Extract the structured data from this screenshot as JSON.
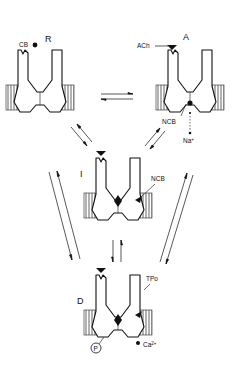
{
  "figure": {
    "type": "kinetic scheme of ion channel states",
    "colors": {
      "ink": "#111111",
      "background": "#ffffff"
    },
    "states": {
      "R": {
        "label": "R",
        "ligand": "CB"
      },
      "A": {
        "label": "A",
        "ligand": "ACh",
        "blocker": "NCB",
        "ion": "Na",
        "ion_charge": "+"
      },
      "I": {
        "label": "I",
        "blocker": "NCB"
      },
      "D": {
        "label": "D",
        "site": "TPo",
        "phospho": "P",
        "ion": "Ca",
        "ion_charge": "2+"
      }
    },
    "transitions": [
      {
        "from": "R",
        "to": "A",
        "type": "reversible"
      },
      {
        "from": "R",
        "to": "I",
        "type": "reversible"
      },
      {
        "from": "A",
        "to": "I",
        "type": "reversible"
      },
      {
        "from": "I",
        "to": "D",
        "type": "reversible"
      },
      {
        "from": "R",
        "to": "D",
        "type": "reversible"
      },
      {
        "from": "A",
        "to": "D",
        "type": "reversible"
      }
    ]
  }
}
